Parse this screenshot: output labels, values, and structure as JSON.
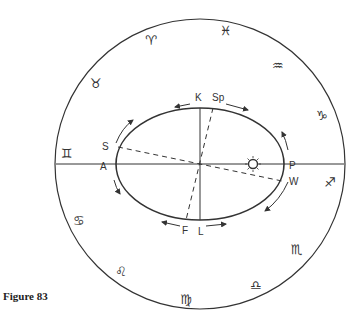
{
  "caption": "Figure 83",
  "zodiac": {
    "aries": "♈",
    "pisces": "♓",
    "aquarius": "♒",
    "capricorn": "♑",
    "taurus": "♉",
    "gemini": "♊",
    "sagittarius": "♐",
    "cancer": "♋",
    "scorpio": "♏",
    "leo": "♌",
    "libra": "♎",
    "virgo": "♍"
  },
  "orbit_labels": {
    "K": "K",
    "Sp": "Sp",
    "S": "S",
    "A": "A",
    "P": "P",
    "W": "W",
    "F": "F",
    "L": "L"
  },
  "sun_symbol": "sun"
}
